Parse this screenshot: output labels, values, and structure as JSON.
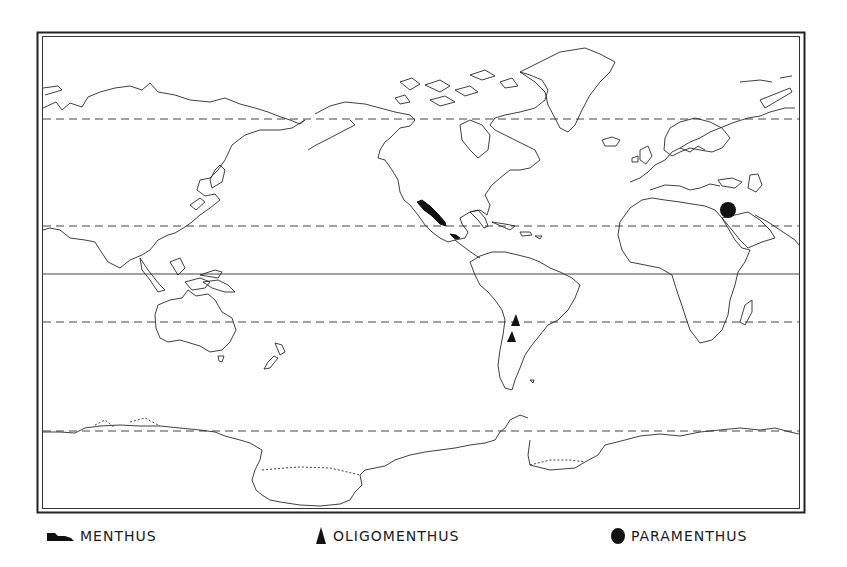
{
  "map": {
    "projection": "world map (Pacific-centered, Mercator-like outline)",
    "latitude_lines": [
      {
        "name": "north-60",
        "style": "dashed",
        "y": 119
      },
      {
        "name": "tropic-of-cancer",
        "style": "dashed",
        "y": 226
      },
      {
        "name": "equator",
        "style": "solid",
        "y": 274
      },
      {
        "name": "tropic-of-capricorn",
        "style": "dashed",
        "y": 322
      },
      {
        "name": "south-60",
        "style": "dashed",
        "y": 431
      }
    ],
    "occurrences": [
      {
        "taxon": "MENTHUS",
        "region": "western Mexico",
        "symbol": "shaded-area"
      },
      {
        "taxon": "MENTHUS",
        "region": "southern Mexico / Central America",
        "symbol": "shaded-area"
      },
      {
        "taxon": "OLIGOMENTHUS",
        "region": "northern Argentina / Chile (site 1)",
        "symbol": "triangle"
      },
      {
        "taxon": "OLIGOMENTHUS",
        "region": "northern Argentina / Chile (site 2)",
        "symbol": "triangle"
      },
      {
        "taxon": "PARAMENTHUS",
        "region": "Middle East (Levant)",
        "symbol": "dot"
      }
    ],
    "colors": {
      "land_outline": "#2a2a2a",
      "symbol_fill": "#111111",
      "background": "#ffffff"
    }
  },
  "legend": {
    "items": [
      {
        "label": "MENTHUS",
        "icon": "shaded-area-icon"
      },
      {
        "label": "OLIGOMENTHUS",
        "icon": "triangle-icon"
      },
      {
        "label": "PARAMENTHUS",
        "icon": "dot-icon"
      }
    ]
  }
}
